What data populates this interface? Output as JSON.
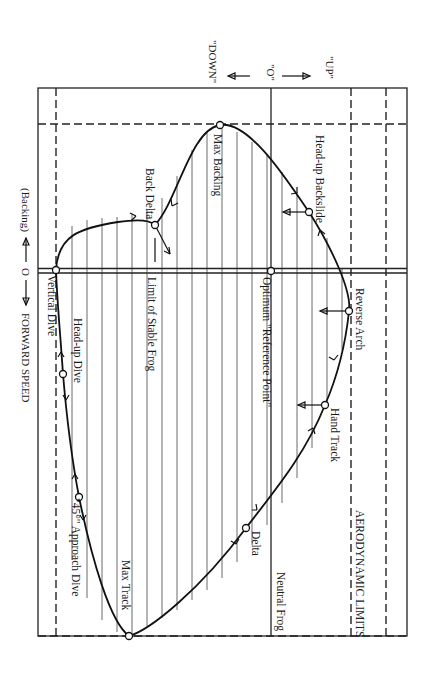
{
  "diagram": {
    "orientation": "rotated 90 degrees clockwise",
    "axes": {
      "vertical_speed": {
        "up_label": "\"UP\"",
        "zero_label": "\"O\"",
        "down_label": "\"DOWN\""
      },
      "horizontal_speed": {
        "backing_label": "(Backing)",
        "zero_label": "O",
        "forward_label": "FORWARD SPEED"
      }
    },
    "boundaries": {
      "aerodynamic_limits": "AERODYNAMIC LIMITS",
      "neutral_frog": "Neutral Frog",
      "limit_of_stable_frog": "Limit of Stable Frog",
      "optimum_reference": "Optimum \"Reference Point\""
    },
    "positions": [
      {
        "id": "vertical-dive",
        "label": "Vertical Dive"
      },
      {
        "id": "head-up-dive",
        "label": "Head-up Dive"
      },
      {
        "id": "approach-dive",
        "label": "\"45°\" Approach Dive"
      },
      {
        "id": "max-track",
        "label": "Max Track"
      },
      {
        "id": "delta",
        "label": "Delta"
      },
      {
        "id": "hand-track",
        "label": "Hand Track"
      },
      {
        "id": "reverse-arch",
        "label": "Reverse Arch"
      },
      {
        "id": "head-up-backslide",
        "label": "Head-up Backslide"
      },
      {
        "id": "max-backing",
        "label": "Max Backing"
      },
      {
        "id": "back-delta",
        "label": "Back Delta"
      }
    ]
  }
}
